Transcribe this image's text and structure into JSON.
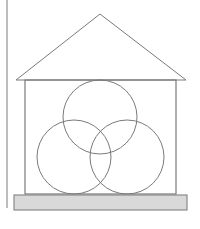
{
  "diagram": {
    "title": "",
    "colors": {
      "background": "#ffffff",
      "stroke": "#7a7a7a",
      "margin_line": "#9a9a9a",
      "base_fill": "#d9d9d9",
      "base_stroke": "#8a8a8a"
    },
    "margin_line": {
      "x": 7,
      "y1": 0,
      "y2": 208
    },
    "roof": {
      "apex": [
        100,
        14
      ],
      "left": [
        16,
        80
      ],
      "right": [
        186,
        80
      ]
    },
    "walls": {
      "x": 25,
      "y": 80,
      "width": 151,
      "height": 114
    },
    "base": {
      "x": 14,
      "y": 195,
      "width": 173,
      "height": 15
    },
    "circles": [
      {
        "name": "top",
        "cx": 100,
        "cy": 117,
        "r": 37
      },
      {
        "name": "bottom-left",
        "cx": 74,
        "cy": 157,
        "r": 37
      },
      {
        "name": "bottom-right",
        "cx": 127,
        "cy": 157,
        "r": 37
      }
    ]
  }
}
